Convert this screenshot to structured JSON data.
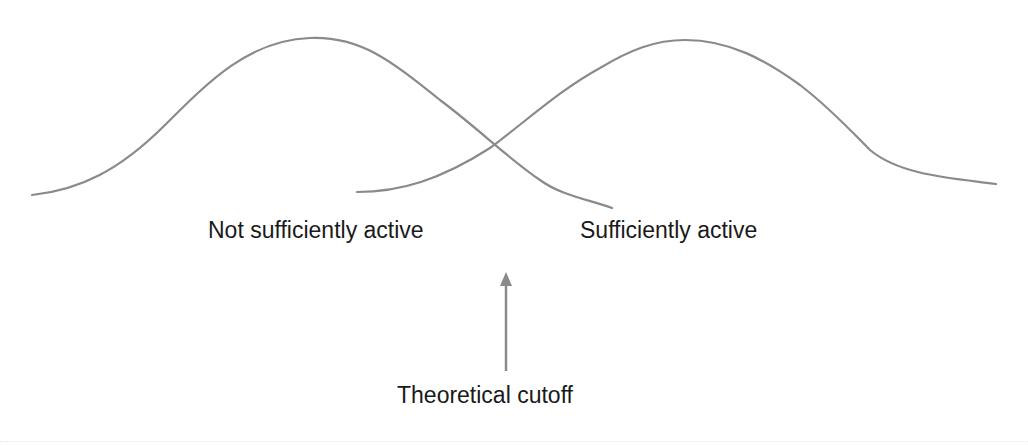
{
  "diagram": {
    "type": "overlapping-distributions",
    "stroke_color": "#8a8a8a",
    "text_color": "#1a1a1a",
    "curves": [
      {
        "name": "not-sufficiently-active-distribution",
        "label": "Not sufficiently active",
        "path": "M32,195 C80,190 120,170 165,125 C210,80 250,40 310,38 C360,36 390,60 440,100 C480,130 510,160 540,180 C560,195 590,200 612,208"
      },
      {
        "name": "sufficiently-active-distribution",
        "label": "Sufficiently active",
        "path": "M357,192 C400,192 440,180 490,148 C530,118 560,90 600,68 C630,50 655,40 685,40 C730,40 765,60 800,85 C830,108 850,130 870,150 C900,175 950,178 996,184"
      }
    ],
    "labels": {
      "left": "Not sufficiently active",
      "right": "Sufficiently active",
      "cutoff": "Theoretical cutoff"
    },
    "arrow": {
      "name": "cutoff-arrow",
      "x": 506,
      "tip_y": 272,
      "tail_y": 371,
      "color": "#8a8a8a"
    }
  }
}
